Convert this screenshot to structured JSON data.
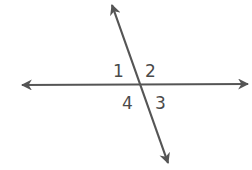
{
  "diagram": {
    "title": "",
    "colors": {
      "line": "#555555",
      "text": "#4a4a4a",
      "background": "#ffffff"
    },
    "lines": [
      {
        "name": "horizontal-line",
        "x1": 22,
        "y1": 85,
        "x2": 248,
        "y2": 84
      },
      {
        "name": "transversal-line",
        "x1": 112,
        "y1": 5,
        "x2": 168,
        "y2": 163
      }
    ],
    "angle_labels": [
      {
        "text": "1",
        "x": 113,
        "y": 77
      },
      {
        "text": "2",
        "x": 145,
        "y": 77
      },
      {
        "text": "4",
        "x": 122,
        "y": 109
      },
      {
        "text": "3",
        "x": 155,
        "y": 109
      }
    ]
  }
}
